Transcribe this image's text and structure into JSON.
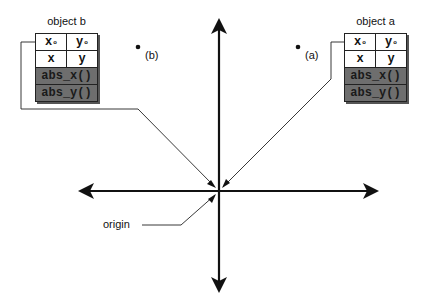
{
  "diagram": {
    "type": "coordinate-system-objects",
    "objects": [
      {
        "id": "b",
        "title": "object b",
        "fields": [
          [
            "x",
            "y"
          ],
          [
            "x",
            "y"
          ]
        ],
        "field_subscripts": [
          "o",
          "o"
        ],
        "methods": [
          "abs_x()",
          "abs_y()"
        ]
      },
      {
        "id": "a",
        "title": "object a",
        "fields": [
          [
            "x",
            "y"
          ],
          [
            "x",
            "y"
          ]
        ],
        "field_subscripts": [
          "o",
          "o"
        ],
        "methods": [
          "abs_x()",
          "abs_y()"
        ]
      }
    ],
    "points": [
      {
        "label": "(b)"
      },
      {
        "label": "(a)"
      }
    ],
    "origin_label": "origin",
    "colors": {
      "line": "#111111",
      "method_fill": "#6e6e6e",
      "background": "#ffffff"
    }
  }
}
